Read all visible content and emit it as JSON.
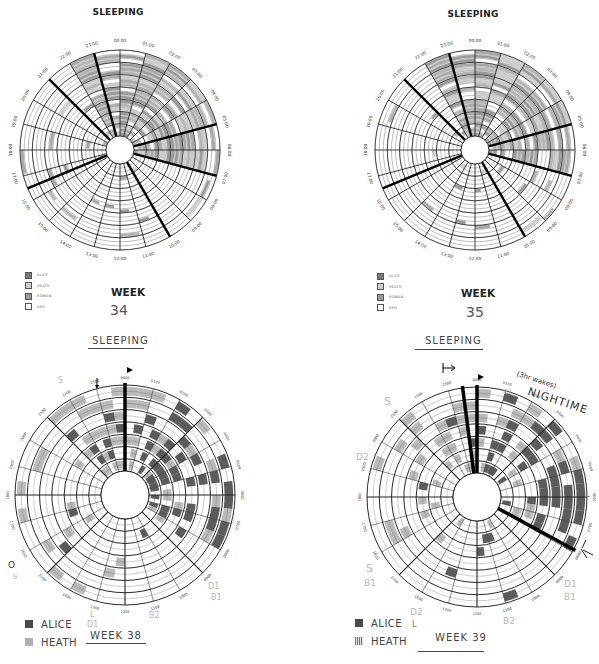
{
  "charts": [
    {
      "id": "week34",
      "title": "SLEEPING",
      "week_label": "WEEK",
      "week_number": "34",
      "style": "printed",
      "legend": [
        {
          "label": "ALICE",
          "color": "#7a7a7a"
        },
        {
          "label": "HEATH",
          "color": "#bdbdbd"
        },
        {
          "label": "ROWAN",
          "color": "#9a9a9a"
        },
        {
          "label": "ASH",
          "color": "#ffffff"
        }
      ]
    },
    {
      "id": "week35",
      "title": "SLEEPING",
      "week_label": "WEEK",
      "week_number": "35",
      "style": "printed",
      "legend": [
        {
          "label": "ALICE",
          "color": "#7a7a7a"
        },
        {
          "label": "HEATH",
          "color": "#bdbdbd"
        },
        {
          "label": "ROWAN",
          "color": "#9a9a9a"
        },
        {
          "label": "ASH",
          "color": "#ffffff"
        }
      ]
    },
    {
      "id": "week38",
      "title": "SLEEPING",
      "week_label": "WEEK 38",
      "style": "handdrawn",
      "legend": [
        {
          "label": "ALICE",
          "color": "#4a4a4a"
        },
        {
          "label": "HEATH",
          "color": "#b0b0b0"
        }
      ],
      "annotations": [
        "S",
        "D",
        "L",
        "D1",
        "B1",
        "B2",
        "L",
        "D",
        "S",
        "O",
        "S"
      ]
    },
    {
      "id": "week39",
      "title": "SLEEPING",
      "week_label": "WEEK 39",
      "style": "handdrawn",
      "legend": [
        {
          "label": "ALICE",
          "color": "#4a4a4a"
        },
        {
          "label": "HEATH",
          "color": "#b0b0b0"
        }
      ],
      "annotations": {
        "nighttime_note": "(3hr wakes)",
        "nighttime": "NIGHTIME",
        "b1_top": "B1",
        "s2_top": "S2",
        "s_left": "S",
        "d2_left": "D2",
        "s_bottom_left": "S",
        "b1_bottom_left": "B1",
        "d2_bottom": "D2",
        "l_bottom": "L",
        "b2_bottom": "B2",
        "d1_right": "D1",
        "b1_right": "B1",
        "l_right": "L"
      }
    }
  ],
  "chart_data": [
    {
      "type": "radial-heatmap",
      "title": "SLEEPING — WEEK 34",
      "axis": "24-hour clock, 00:00 at top, clockwise",
      "tick_labels": [
        "00:00",
        "01:00",
        "02:00",
        "03:00",
        "04:00",
        "05:00",
        "06:00",
        "07:00",
        "08:00",
        "09:00",
        "10:00",
        "11:00",
        "12:00",
        "13:00",
        "14:00",
        "15:00",
        "16:00",
        "17:00",
        "18:00",
        "19:00",
        "20:00",
        "21:00",
        "22:00",
        "23:00"
      ],
      "rings": 7,
      "series": [
        {
          "name": "ALICE"
        },
        {
          "name": "HEATH"
        },
        {
          "name": "ROWAN"
        },
        {
          "name": "ASH"
        }
      ],
      "highlight_spokes": [
        "21:00",
        "23:00",
        "05:00",
        "07:00",
        "10:00",
        "16:30"
      ],
      "note": "Sleep concentrated roughly 22:00–07:00; sparse daytime naps"
    },
    {
      "type": "radial-heatmap",
      "title": "SLEEPING — WEEK 35",
      "axis": "24-hour clock, 00:00 at top, clockwise",
      "tick_labels": [
        "00:00",
        "01:00",
        "02:00",
        "03:00",
        "04:00",
        "05:00",
        "06:00",
        "07:00",
        "08:00",
        "09:00",
        "10:00",
        "11:00",
        "12:00",
        "13:00",
        "14:00",
        "15:00",
        "16:00",
        "17:00",
        "18:00",
        "19:00",
        "20:00",
        "21:00",
        "22:00",
        "23:00"
      ],
      "rings": 7,
      "series": [
        {
          "name": "ALICE"
        },
        {
          "name": "HEATH"
        },
        {
          "name": "ROWAN"
        },
        {
          "name": "ASH"
        }
      ],
      "highlight_spokes": [
        "21:00",
        "23:00",
        "05:00",
        "07:00",
        "10:00",
        "16:30"
      ],
      "note": "Sleep concentrated roughly 22:00–07:00; sparse daytime naps"
    },
    {
      "type": "radial-heatmap",
      "title": "SLEEPING — WEEK 38",
      "axis": "24-hour clock, 0000 at top, clockwise",
      "tick_labels": [
        "0000",
        "0100",
        "0200",
        "0300",
        "0400",
        "0500",
        "0600",
        "0700",
        "0800",
        "0900",
        "1000",
        "1100",
        "1200",
        "1300",
        "1400",
        "1500",
        "1600",
        "1700",
        "1800",
        "1900",
        "2000",
        "2100",
        "2200",
        "2300"
      ],
      "rings": 7,
      "series": [
        {
          "name": "ALICE"
        },
        {
          "name": "HEATH"
        }
      ],
      "highlight_spokes": [
        "0000"
      ]
    },
    {
      "type": "radial-heatmap",
      "title": "SLEEPING — WEEK 39",
      "axis": "24-hour clock, 0000 at top, clockwise",
      "tick_labels": [
        "0000",
        "0100",
        "0200",
        "0300",
        "0400",
        "0500",
        "0600",
        "0700",
        "0800",
        "0900",
        "1000",
        "1100",
        "1200",
        "1300",
        "1400",
        "1500",
        "1600",
        "1700",
        "1800",
        "1900",
        "2000",
        "2100",
        "2200",
        "2300"
      ],
      "rings": 7,
      "series": [
        {
          "name": "ALICE"
        },
        {
          "name": "HEATH"
        }
      ],
      "highlight_spokes": [
        "2300",
        "0000",
        "0800"
      ],
      "annotation": "(3hr wakes) NIGHTIME"
    }
  ]
}
